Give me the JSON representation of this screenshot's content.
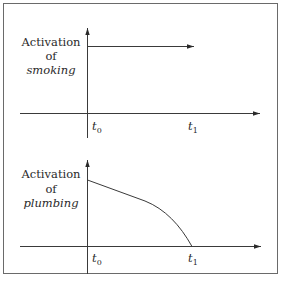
{
  "figure": {
    "top_panel": {
      "ylabel_line1": "Activation",
      "ylabel_line2": "of",
      "ylabel_line3": "smoking",
      "t0_label": "t",
      "t0_sub": "0",
      "t1_label": "t",
      "t1_sub": "1",
      "description": "constant activation starting at t0, continuing past t1"
    },
    "bottom_panel": {
      "ylabel_line1": "Activation",
      "ylabel_line2": "of",
      "ylabel_line3": "plumbing",
      "t0_label": "t",
      "t0_sub": "0",
      "t1_label": "t",
      "t1_sub": "1",
      "description": "activation decreasing from t0, reaching zero at t1"
    }
  }
}
